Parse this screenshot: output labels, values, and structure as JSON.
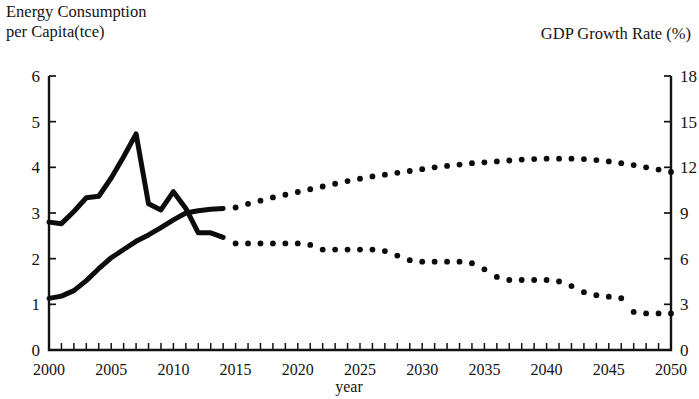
{
  "labels": {
    "left_axis_title": "Energy Consumption\nper Capita(tce)",
    "right_axis_title": "GDP Growth Rate (%)",
    "x_axis_title": "year"
  },
  "chart_data": {
    "type": "line",
    "title": "",
    "xlabel": "year",
    "ylabel": "Energy Consumption per Capita(tce)",
    "y2label": "GDP Growth Rate (%)",
    "xlim": [
      2000,
      2050
    ],
    "ylim": [
      0,
      6
    ],
    "y2lim": [
      0,
      18
    ],
    "grid": false,
    "legend": "none",
    "xticks": [
      2000,
      2005,
      2010,
      2015,
      2020,
      2025,
      2030,
      2035,
      2040,
      2045,
      2050
    ],
    "xticklabels": [
      "2000",
      "2005",
      "2010",
      "2015",
      "2020",
      "2025",
      "2030",
      "2035",
      "2040",
      "2045",
      "2050"
    ],
    "xminorticks_step": 1,
    "yticks": [
      0,
      1,
      2,
      3,
      4,
      5,
      6
    ],
    "yticklabels": [
      "0",
      "1",
      "2",
      "3",
      "4",
      "5",
      "6"
    ],
    "y2ticks": [
      0,
      3,
      6,
      9,
      12,
      15,
      18
    ],
    "y2ticklabels": [
      "0",
      "3",
      "6",
      "9",
      "12",
      "15",
      "18"
    ],
    "series": [
      {
        "name": "Energy Consumption per Capita (tce)",
        "axis": "left",
        "style_history": "solid",
        "style_forecast": "dotted",
        "history_end_year": 2014,
        "x": [
          2000,
          2001,
          2002,
          2003,
          2004,
          2005,
          2006,
          2007,
          2008,
          2009,
          2010,
          2011,
          2012,
          2013,
          2014
        ],
        "values": [
          1.13,
          1.18,
          1.3,
          1.52,
          1.78,
          2.02,
          2.2,
          2.38,
          2.52,
          2.68,
          2.85,
          3.0,
          3.05,
          3.08,
          3.1
        ]
      },
      {
        "name": "Energy Consumption per Capita (tce) forecast",
        "axis": "left",
        "style_history": "dotted",
        "style_forecast": "dotted",
        "history_end_year": 2014,
        "x": [
          2015,
          2016,
          2017,
          2018,
          2019,
          2020,
          2021,
          2022,
          2023,
          2024,
          2025,
          2026,
          2027,
          2028,
          2029,
          2030,
          2031,
          2032,
          2033,
          2034,
          2035,
          2036,
          2037,
          2038,
          2039,
          2040,
          2041,
          2042,
          2043,
          2044,
          2045,
          2046,
          2047,
          2048,
          2049,
          2050
        ],
        "values": [
          3.12,
          3.2,
          3.27,
          3.34,
          3.4,
          3.46,
          3.52,
          3.58,
          3.64,
          3.7,
          3.75,
          3.8,
          3.84,
          3.88,
          3.92,
          3.96,
          4.0,
          4.03,
          4.06,
          4.09,
          4.11,
          4.13,
          4.15,
          4.17,
          4.18,
          4.19,
          4.19,
          4.19,
          4.18,
          4.16,
          4.13,
          4.09,
          4.05,
          4.0,
          3.95,
          3.9
        ]
      },
      {
        "name": "GDP Growth Rate (%)",
        "axis": "right",
        "style_history": "solid",
        "style_forecast": "dotted",
        "history_end_year": 2014,
        "x": [
          2000,
          2001,
          2002,
          2003,
          2004,
          2005,
          2006,
          2007,
          2008,
          2009,
          2010,
          2011,
          2012,
          2013,
          2014
        ],
        "values": [
          8.4,
          8.3,
          9.1,
          10.0,
          10.1,
          11.3,
          12.7,
          14.2,
          9.6,
          9.2,
          10.4,
          9.3,
          7.7,
          7.7,
          7.4
        ]
      },
      {
        "name": "GDP Growth Rate (%) forecast",
        "axis": "right",
        "style_history": "dotted",
        "style_forecast": "dotted",
        "history_end_year": 2014,
        "x": [
          2015,
          2016,
          2017,
          2018,
          2019,
          2020,
          2021,
          2022,
          2023,
          2024,
          2025,
          2026,
          2027,
          2028,
          2029,
          2030,
          2031,
          2032,
          2033,
          2034,
          2035,
          2036,
          2037,
          2038,
          2039,
          2040,
          2041,
          2042,
          2043,
          2044,
          2045,
          2046,
          2047,
          2048,
          2049,
          2050
        ],
        "values": [
          7.0,
          7.0,
          7.0,
          7.0,
          7.0,
          7.0,
          6.9,
          6.6,
          6.6,
          6.6,
          6.6,
          6.6,
          6.5,
          6.2,
          5.9,
          5.8,
          5.8,
          5.8,
          5.8,
          5.7,
          5.3,
          4.8,
          4.6,
          4.6,
          4.6,
          4.6,
          4.5,
          4.2,
          3.8,
          3.6,
          3.5,
          3.4,
          2.5,
          2.4,
          2.4,
          2.4
        ]
      }
    ]
  },
  "colors": {
    "ink": "#0c0c0c",
    "background": "#ffffff"
  }
}
